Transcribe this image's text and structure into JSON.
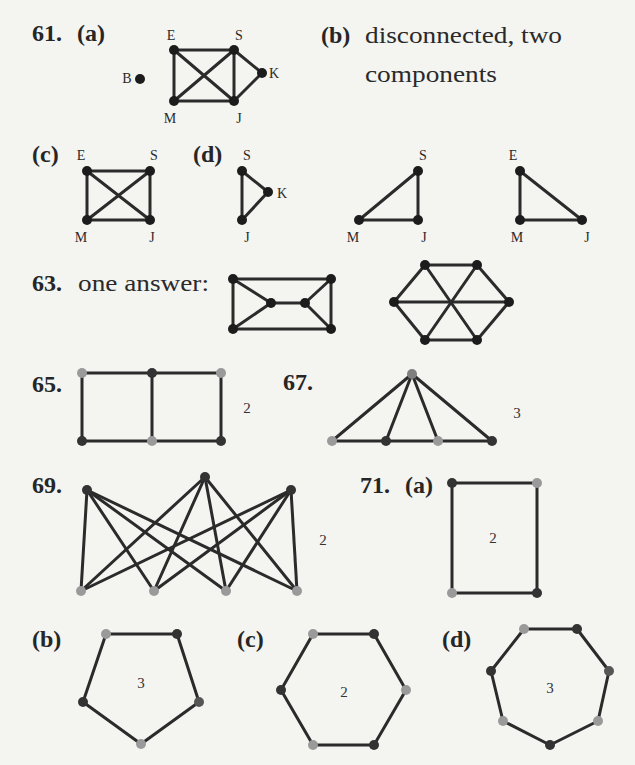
{
  "page": {
    "background": "#f4f4f1",
    "text_color": "#262626"
  },
  "colors": {
    "edge": "#2b2b2b",
    "black": "#1c1c1c",
    "dark": "#333333",
    "light": "#9a9a9a",
    "mid": "#565656",
    "apex": "#7f7f7f"
  },
  "problems": {
    "p61": {
      "number": "61.",
      "a": {
        "label": "(a)"
      },
      "b": {
        "label": "(b)",
        "line1": "disconnected, two",
        "line2": "components"
      },
      "c": {
        "label": "(c)"
      },
      "d": {
        "label": "(d)"
      }
    },
    "p63": {
      "number": "63.",
      "text": "one answer:"
    },
    "p65": {
      "number": "65."
    },
    "p67": {
      "number": "67."
    },
    "p69": {
      "number": "69."
    },
    "p71": {
      "number": "71.",
      "a": {
        "label": "(a)"
      },
      "b": {
        "label": "(b)"
      },
      "c": {
        "label": "(c)"
      },
      "d": {
        "label": "(d)"
      }
    }
  },
  "graphs": [
    {
      "id": "61a",
      "nodes": [
        {
          "id": "E",
          "x": 174,
          "y": 50,
          "color": "black",
          "label": "E",
          "lx": 171,
          "ly": 40
        },
        {
          "id": "S",
          "x": 234,
          "y": 50,
          "color": "black",
          "label": "S",
          "lx": 239,
          "ly": 40
        },
        {
          "id": "K",
          "x": 262,
          "y": 73,
          "color": "black",
          "label": "K",
          "lx": 274,
          "ly": 78
        },
        {
          "id": "M",
          "x": 174,
          "y": 101,
          "color": "black",
          "label": "M",
          "lx": 170,
          "ly": 123
        },
        {
          "id": "J",
          "x": 234,
          "y": 101,
          "color": "black",
          "label": "J",
          "lx": 239,
          "ly": 123
        },
        {
          "id": "B",
          "x": 140,
          "y": 79,
          "color": "black",
          "label": "B",
          "lx": 127,
          "ly": 83
        }
      ],
      "edges": [
        [
          "E",
          "S"
        ],
        [
          "E",
          "M"
        ],
        [
          "E",
          "J"
        ],
        [
          "S",
          "M"
        ],
        [
          "S",
          "J"
        ],
        [
          "S",
          "K"
        ],
        [
          "M",
          "J"
        ],
        [
          "J",
          "K"
        ]
      ]
    },
    {
      "id": "61c",
      "nodes": [
        {
          "id": "E",
          "x": 87,
          "y": 171,
          "color": "black",
          "label": "E",
          "lx": 81,
          "ly": 160
        },
        {
          "id": "S",
          "x": 150,
          "y": 171,
          "color": "black",
          "label": "S",
          "lx": 154,
          "ly": 160
        },
        {
          "id": "M",
          "x": 87,
          "y": 220,
          "color": "black",
          "label": "M",
          "lx": 81,
          "ly": 242
        },
        {
          "id": "J",
          "x": 150,
          "y": 220,
          "color": "black",
          "label": "J",
          "lx": 152,
          "ly": 242
        }
      ],
      "edges": [
        [
          "E",
          "S"
        ],
        [
          "E",
          "M"
        ],
        [
          "E",
          "J"
        ],
        [
          "S",
          "M"
        ],
        [
          "S",
          "J"
        ],
        [
          "M",
          "J"
        ]
      ]
    },
    {
      "id": "61d-1",
      "nodes": [
        {
          "id": "S",
          "x": 242,
          "y": 171,
          "color": "black",
          "label": "S",
          "lx": 247,
          "ly": 160
        },
        {
          "id": "K",
          "x": 268,
          "y": 192,
          "color": "black",
          "label": "K",
          "lx": 282,
          "ly": 198
        },
        {
          "id": "J",
          "x": 242,
          "y": 220,
          "color": "black",
          "label": "J",
          "lx": 247,
          "ly": 242
        }
      ],
      "edges": [
        [
          "S",
          "K"
        ],
        [
          "S",
          "J"
        ],
        [
          "K",
          "J"
        ]
      ]
    },
    {
      "id": "61d-2",
      "nodes": [
        {
          "id": "S",
          "x": 418,
          "y": 171,
          "color": "black",
          "label": "S",
          "lx": 423,
          "ly": 160
        },
        {
          "id": "M",
          "x": 359,
          "y": 220,
          "color": "black",
          "label": "M",
          "lx": 353,
          "ly": 242
        },
        {
          "id": "J",
          "x": 418,
          "y": 220,
          "color": "black",
          "label": "J",
          "lx": 424,
          "ly": 242
        }
      ],
      "edges": [
        [
          "S",
          "M"
        ],
        [
          "S",
          "J"
        ],
        [
          "M",
          "J"
        ]
      ]
    },
    {
      "id": "61d-3",
      "nodes": [
        {
          "id": "E",
          "x": 520,
          "y": 171,
          "color": "black",
          "label": "E",
          "lx": 513,
          "ly": 160
        },
        {
          "id": "M",
          "x": 520,
          "y": 220,
          "color": "black",
          "label": "M",
          "lx": 517,
          "ly": 242
        },
        {
          "id": "J",
          "x": 582,
          "y": 220,
          "color": "black",
          "label": "J",
          "lx": 587,
          "ly": 242
        }
      ],
      "edges": [
        [
          "E",
          "M"
        ],
        [
          "E",
          "J"
        ],
        [
          "M",
          "J"
        ]
      ]
    },
    {
      "id": "63a",
      "nodes": [
        {
          "id": "1",
          "x": 233,
          "y": 279,
          "color": "black"
        },
        {
          "id": "2",
          "x": 331,
          "y": 279,
          "color": "black"
        },
        {
          "id": "3",
          "x": 233,
          "y": 329,
          "color": "black"
        },
        {
          "id": "4",
          "x": 331,
          "y": 329,
          "color": "black"
        },
        {
          "id": "5",
          "x": 271,
          "y": 303,
          "color": "black"
        },
        {
          "id": "6",
          "x": 305,
          "y": 303,
          "color": "black"
        }
      ],
      "edges": [
        [
          "1",
          "2"
        ],
        [
          "3",
          "4"
        ],
        [
          "1",
          "3"
        ],
        [
          "2",
          "4"
        ],
        [
          "1",
          "5"
        ],
        [
          "3",
          "5"
        ],
        [
          "5",
          "6"
        ],
        [
          "2",
          "6"
        ],
        [
          "4",
          "6"
        ]
      ]
    },
    {
      "id": "63b",
      "nodes": [
        {
          "id": "1",
          "x": 425,
          "y": 265,
          "color": "black"
        },
        {
          "id": "2",
          "x": 477,
          "y": 265,
          "color": "black"
        },
        {
          "id": "3",
          "x": 509,
          "y": 302,
          "color": "black"
        },
        {
          "id": "4",
          "x": 477,
          "y": 340,
          "color": "black"
        },
        {
          "id": "5",
          "x": 425,
          "y": 340,
          "color": "black"
        },
        {
          "id": "6",
          "x": 394,
          "y": 302,
          "color": "black"
        }
      ],
      "edges": [
        [
          "1",
          "2"
        ],
        [
          "2",
          "3"
        ],
        [
          "3",
          "4"
        ],
        [
          "4",
          "5"
        ],
        [
          "5",
          "6"
        ],
        [
          "6",
          "1"
        ],
        [
          "1",
          "4"
        ],
        [
          "2",
          "5"
        ],
        [
          "3",
          "6"
        ]
      ]
    },
    {
      "id": "65",
      "nodes": [
        {
          "id": "a",
          "x": 82,
          "y": 373,
          "color": "light"
        },
        {
          "id": "b",
          "x": 152,
          "y": 373,
          "color": "dark"
        },
        {
          "id": "c",
          "x": 221,
          "y": 373,
          "color": "light"
        },
        {
          "id": "d",
          "x": 82,
          "y": 441,
          "color": "dark"
        },
        {
          "id": "e",
          "x": 152,
          "y": 441,
          "color": "light"
        },
        {
          "id": "f",
          "x": 221,
          "y": 441,
          "color": "dark"
        }
      ],
      "edges": [
        [
          "a",
          "b"
        ],
        [
          "b",
          "c"
        ],
        [
          "d",
          "e"
        ],
        [
          "e",
          "f"
        ],
        [
          "a",
          "d"
        ],
        [
          "b",
          "e"
        ],
        [
          "c",
          "f"
        ]
      ],
      "chromatic_number": {
        "text": "2",
        "x": 247,
        "y": 413
      }
    },
    {
      "id": "67",
      "nodes": [
        {
          "id": "a",
          "x": 412,
          "y": 374,
          "color": "apex"
        },
        {
          "id": "b",
          "x": 332,
          "y": 441,
          "color": "light"
        },
        {
          "id": "c",
          "x": 386,
          "y": 441,
          "color": "dark"
        },
        {
          "id": "d",
          "x": 438,
          "y": 441,
          "color": "light"
        },
        {
          "id": "e",
          "x": 492,
          "y": 441,
          "color": "dark"
        }
      ],
      "edges": [
        [
          "a",
          "b"
        ],
        [
          "a",
          "c"
        ],
        [
          "a",
          "d"
        ],
        [
          "a",
          "e"
        ],
        [
          "b",
          "c"
        ],
        [
          "c",
          "d"
        ],
        [
          "d",
          "e"
        ]
      ],
      "chromatic_number": {
        "text": "3",
        "x": 517,
        "y": 418
      }
    },
    {
      "id": "69",
      "nodes": [
        {
          "id": "t1",
          "x": 87,
          "y": 490,
          "color": "dark"
        },
        {
          "id": "t2",
          "x": 205,
          "y": 477,
          "color": "dark"
        },
        {
          "id": "t3",
          "x": 291,
          "y": 490,
          "color": "dark"
        },
        {
          "id": "b1",
          "x": 81,
          "y": 591,
          "color": "light"
        },
        {
          "id": "b2",
          "x": 154,
          "y": 591,
          "color": "light"
        },
        {
          "id": "b3",
          "x": 226,
          "y": 591,
          "color": "light"
        },
        {
          "id": "b4",
          "x": 297,
          "y": 591,
          "color": "light"
        }
      ],
      "edges": [
        [
          "t1",
          "b1"
        ],
        [
          "t1",
          "b2"
        ],
        [
          "t1",
          "b3"
        ],
        [
          "t1",
          "b4"
        ],
        [
          "t2",
          "b1"
        ],
        [
          "t2",
          "b2"
        ],
        [
          "t2",
          "b3"
        ],
        [
          "t2",
          "b4"
        ],
        [
          "t3",
          "b1"
        ],
        [
          "t3",
          "b2"
        ],
        [
          "t3",
          "b3"
        ],
        [
          "t3",
          "b4"
        ]
      ],
      "chromatic_number": {
        "text": "2",
        "x": 323,
        "y": 545
      }
    },
    {
      "id": "71a",
      "nodes": [
        {
          "id": "a",
          "x": 452,
          "y": 483,
          "color": "dark"
        },
        {
          "id": "b",
          "x": 537,
          "y": 483,
          "color": "light"
        },
        {
          "id": "c",
          "x": 537,
          "y": 593,
          "color": "dark"
        },
        {
          "id": "d",
          "x": 452,
          "y": 593,
          "color": "light"
        }
      ],
      "edges": [
        [
          "a",
          "b"
        ],
        [
          "b",
          "c"
        ],
        [
          "c",
          "d"
        ],
        [
          "d",
          "a"
        ]
      ],
      "chromatic_number": {
        "text": "2",
        "x": 493,
        "y": 543
      }
    },
    {
      "id": "71b",
      "nodes": [
        {
          "id": "a",
          "x": 106,
          "y": 634,
          "color": "light"
        },
        {
          "id": "b",
          "x": 177,
          "y": 634,
          "color": "dark"
        },
        {
          "id": "c",
          "x": 199,
          "y": 702,
          "color": "mid"
        },
        {
          "id": "d",
          "x": 141,
          "y": 744,
          "color": "light"
        },
        {
          "id": "e",
          "x": 83,
          "y": 702,
          "color": "dark"
        }
      ],
      "edges": [
        [
          "a",
          "b"
        ],
        [
          "b",
          "c"
        ],
        [
          "c",
          "d"
        ],
        [
          "d",
          "e"
        ],
        [
          "e",
          "a"
        ]
      ],
      "chromatic_number": {
        "text": "3",
        "x": 141,
        "y": 688
      }
    },
    {
      "id": "71c",
      "nodes": [
        {
          "id": "a",
          "x": 313,
          "y": 634,
          "color": "light"
        },
        {
          "id": "b",
          "x": 374,
          "y": 634,
          "color": "dark"
        },
        {
          "id": "c",
          "x": 406,
          "y": 690,
          "color": "light"
        },
        {
          "id": "d",
          "x": 374,
          "y": 745,
          "color": "dark"
        },
        {
          "id": "e",
          "x": 313,
          "y": 745,
          "color": "light"
        },
        {
          "id": "f",
          "x": 281,
          "y": 690,
          "color": "dark"
        }
      ],
      "edges": [
        [
          "a",
          "b"
        ],
        [
          "b",
          "c"
        ],
        [
          "c",
          "d"
        ],
        [
          "d",
          "e"
        ],
        [
          "e",
          "f"
        ],
        [
          "f",
          "a"
        ]
      ],
      "chromatic_number": {
        "text": "2",
        "x": 344,
        "y": 697
      }
    },
    {
      "id": "71d",
      "nodes": [
        {
          "id": "a",
          "x": 524,
          "y": 629,
          "color": "light"
        },
        {
          "id": "b",
          "x": 577,
          "y": 629,
          "color": "dark"
        },
        {
          "id": "c",
          "x": 609,
          "y": 671,
          "color": "mid"
        },
        {
          "id": "d",
          "x": 598,
          "y": 721,
          "color": "light"
        },
        {
          "id": "e",
          "x": 550,
          "y": 745,
          "color": "dark"
        },
        {
          "id": "f",
          "x": 503,
          "y": 721,
          "color": "light"
        },
        {
          "id": "g",
          "x": 491,
          "y": 671,
          "color": "dark"
        }
      ],
      "edges": [
        [
          "a",
          "b"
        ],
        [
          "b",
          "c"
        ],
        [
          "c",
          "d"
        ],
        [
          "d",
          "e"
        ],
        [
          "e",
          "f"
        ],
        [
          "f",
          "g"
        ],
        [
          "g",
          "a"
        ]
      ],
      "chromatic_number": {
        "text": "3",
        "x": 550,
        "y": 693
      }
    }
  ]
}
